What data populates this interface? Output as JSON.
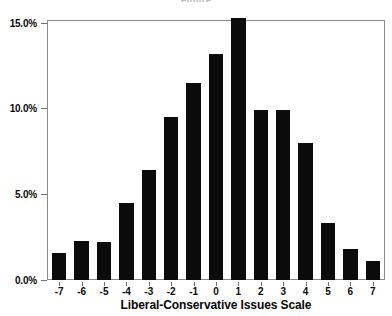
{
  "chart_data": {
    "type": "bar",
    "title": "",
    "xlabel": "Liberal-Conservative Issues Scale",
    "ylabel": "",
    "categories": [
      "-7",
      "-6",
      "-5",
      "-4",
      "-3",
      "-2",
      "-1",
      "0",
      "1",
      "2",
      "3",
      "4",
      "5",
      "6",
      "7"
    ],
    "values": [
      1.6,
      2.3,
      2.2,
      4.5,
      6.4,
      9.5,
      11.5,
      13.2,
      15.3,
      9.9,
      9.9,
      8.0,
      3.3,
      1.8,
      1.1
    ],
    "value_labels": [
      "1.6%",
      "2.3%",
      "2.2%",
      "4.5%",
      "6.4%",
      "9.5%",
      "11.5%",
      "13.2%",
      "15.3%",
      "9.9%",
      "9.9%",
      "8.0%",
      "3.3%",
      "1.8%",
      "1.1%"
    ],
    "ylim": [
      0,
      15.1
    ],
    "yticks": [
      0,
      5,
      10,
      15
    ],
    "ytick_labels": [
      "0.0%",
      "5.0%",
      "10.0%",
      "15.0%"
    ],
    "grid": false,
    "legend": null,
    "bar_color": "#0b0b0b",
    "axis_color": "#8a8a8a"
  },
  "axes": {
    "x_title": "Liberal-Conservative Issues Scale"
  },
  "header": {
    "clipped_title": "Figure"
  }
}
